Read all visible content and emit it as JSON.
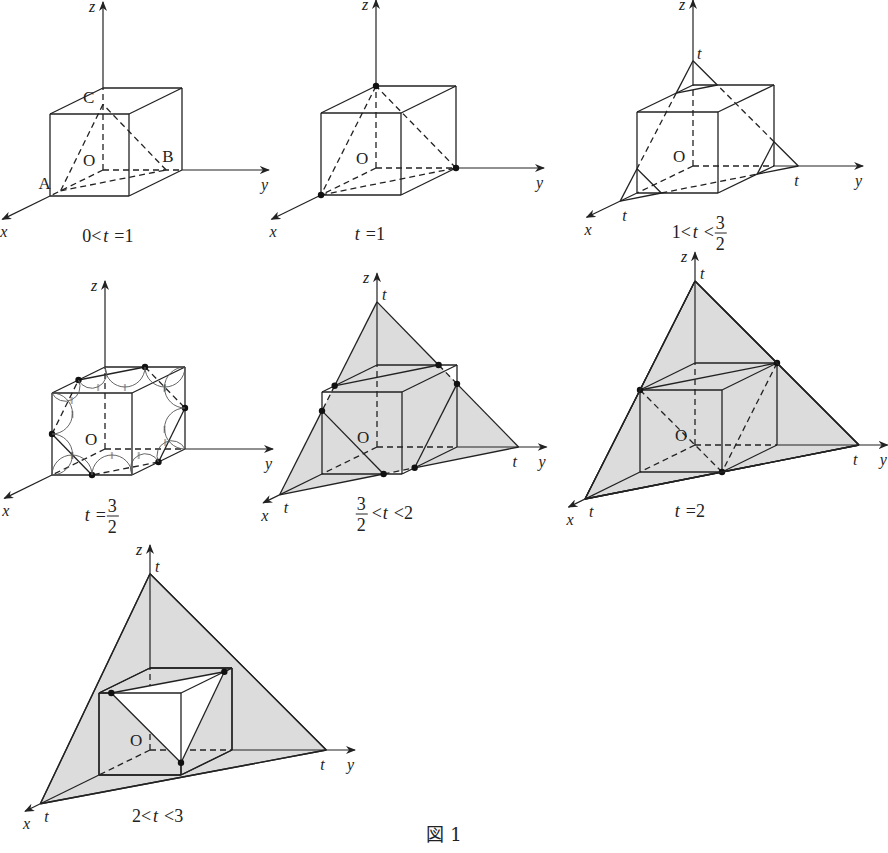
{
  "figure_caption": "図 1",
  "axis_labels": {
    "x": "x",
    "y": "y",
    "z": "z",
    "origin": "O",
    "intercept": "t"
  },
  "colors": {
    "line": "#222222",
    "shade": "#dcdcdc",
    "background": "#ffffff"
  },
  "panels": [
    {
      "id": "p1",
      "caption": "0<t=1",
      "caption_parts": {
        "pre": "0<",
        "var": "t",
        "post": "=1"
      },
      "t": 0.8,
      "origin": [
        103,
        170
      ],
      "ux": [
        -53,
        26
      ],
      "uy": [
        79,
        0
      ],
      "uz": [
        0,
        -82
      ],
      "point_labels": [
        "A",
        "B",
        "C"
      ],
      "mode": "tetra"
    },
    {
      "id": "p2",
      "caption": "t=1",
      "caption_parts": {
        "pre": "",
        "var": "t",
        "post": "=1"
      },
      "t": 1,
      "origin": [
        376,
        168
      ],
      "ux": [
        -55,
        27
      ],
      "uy": [
        80,
        0
      ],
      "uz": [
        0,
        -82
      ],
      "mode": "tetra1"
    },
    {
      "id": "p3",
      "caption": "1<t<3/2",
      "caption_parts": {
        "pre": "1<",
        "var": "t",
        "post": "<",
        "frac": [
          "3",
          "2"
        ]
      },
      "t": 1.3,
      "origin": [
        693,
        166
      ],
      "ux": [
        -56,
        27
      ],
      "uy": [
        81,
        0
      ],
      "uz": [
        0,
        -81
      ],
      "mode": "cut-outline"
    },
    {
      "id": "p4",
      "caption": "t=3/2",
      "caption_parts": {
        "pre": "",
        "var": "t",
        "post": "=",
        "frac": [
          "3",
          "2"
        ]
      },
      "t": 1.5,
      "origin": [
        105,
        449
      ],
      "ux": [
        -53,
        26
      ],
      "uy": [
        80,
        0
      ],
      "uz": [
        0,
        -82
      ],
      "mode": "hexagon"
    },
    {
      "id": "p5",
      "caption": "3/2<t<2",
      "caption_parts": {
        "frac_pre": [
          "3",
          "2"
        ],
        "pre": "<",
        "var": "t",
        "post": "<2"
      },
      "t": 1.77,
      "origin": [
        377,
        447
      ],
      "ux": [
        -55,
        27
      ],
      "uy": [
        80,
        0
      ],
      "uz": [
        0,
        -82
      ],
      "mode": "shaded"
    },
    {
      "id": "p6",
      "caption": "t=2",
      "caption_parts": {
        "pre": "",
        "var": "t",
        "post": "=2"
      },
      "t": 2,
      "origin": [
        695,
        445
      ],
      "ux": [
        -55,
        27
      ],
      "uy": [
        82,
        0
      ],
      "uz": [
        0,
        -82
      ],
      "mode": "shaded"
    },
    {
      "id": "p7",
      "caption": "2<t<3",
      "caption_parts": {
        "pre": "2<",
        "var": "t",
        "post": "<3"
      },
      "t": 2.15,
      "origin": [
        150,
        750
      ],
      "ux": [
        -51,
        25
      ],
      "uy": [
        82,
        0
      ],
      "uz": [
        0,
        -82
      ],
      "mode": "shaded"
    }
  ]
}
